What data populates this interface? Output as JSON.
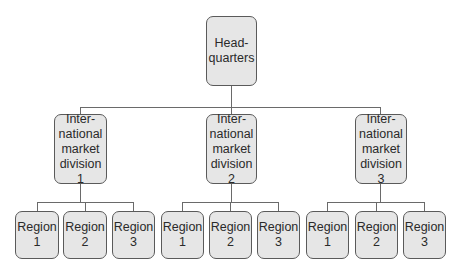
{
  "headquarters": {
    "label": "Head-\nquarters"
  },
  "divisions": [
    {
      "label": "Inter-\nnational\nmarket\ndivision 1",
      "regions": [
        {
          "label": "Region\n1"
        },
        {
          "label": "Region\n2"
        },
        {
          "label": "Region\n3"
        }
      ]
    },
    {
      "label": "Inter-\nnational\nmarket\ndivision 2",
      "regions": [
        {
          "label": "Region\n1"
        },
        {
          "label": "Region\n2"
        },
        {
          "label": "Region\n3"
        }
      ]
    },
    {
      "label": "Inter-\nnational\nmarket\ndivision 3",
      "regions": [
        {
          "label": "Region\n1"
        },
        {
          "label": "Region\n2"
        },
        {
          "label": "Region\n3"
        }
      ]
    }
  ],
  "colors": {
    "box_fill": "#e6e6e6",
    "box_border": "#5a5a5a",
    "connector": "#6a6a6a"
  }
}
